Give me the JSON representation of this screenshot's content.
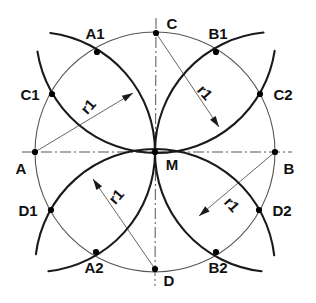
{
  "figure": {
    "type": "geometric-construction",
    "colors": {
      "arc_stroke": "#1a1a1a",
      "circle_stroke": "#555555",
      "axis_stroke": "#555555",
      "label_text": "#111111",
      "point_fill": "#000000",
      "background": "#ffffff"
    },
    "geometry": {
      "center": {
        "name": "M",
        "x": 155,
        "y": 152
      },
      "circle_radius": 120,
      "arc_radius_label": "r1",
      "arc_radius_value": 120
    },
    "points": [
      {
        "name": "A",
        "x": 35,
        "y": 152,
        "label_dx": -14,
        "label_dy": 22,
        "anchor": "middle"
      },
      {
        "name": "B",
        "x": 275,
        "y": 152,
        "label_dx": 14,
        "label_dy": 22,
        "anchor": "middle"
      },
      {
        "name": "C",
        "x": 156,
        "y": 33,
        "label_dx": 16,
        "label_dy": -4,
        "anchor": "middle"
      },
      {
        "name": "D",
        "x": 155,
        "y": 269,
        "label_dx": 14,
        "label_dy": 17,
        "anchor": "middle"
      },
      {
        "name": "M",
        "x": 155,
        "y": 152,
        "label_dx": 17,
        "label_dy": 18,
        "anchor": "middle"
      },
      {
        "name": "A1",
        "x": 97,
        "y": 52,
        "label_dx": -2,
        "label_dy": -13,
        "anchor": "middle"
      },
      {
        "name": "B1",
        "x": 216,
        "y": 52,
        "label_dx": 2,
        "label_dy": -13,
        "anchor": "middle"
      },
      {
        "name": "C1",
        "x": 52,
        "y": 94,
        "label_dx": -22,
        "label_dy": 6,
        "anchor": "middle"
      },
      {
        "name": "C2",
        "x": 260,
        "y": 94,
        "label_dx": 23,
        "label_dy": 6,
        "anchor": "middle"
      },
      {
        "name": "D1",
        "x": 51,
        "y": 210,
        "label_dx": -23,
        "label_dy": 6,
        "anchor": "middle"
      },
      {
        "name": "D2",
        "x": 259,
        "y": 210,
        "label_dx": 23,
        "label_dy": 6,
        "anchor": "middle"
      },
      {
        "name": "A2",
        "x": 96,
        "y": 252,
        "label_dx": -2,
        "label_dy": 21,
        "anchor": "middle"
      },
      {
        "name": "B2",
        "x": 216,
        "y": 252,
        "label_dx": 2,
        "label_dy": 21,
        "anchor": "middle"
      }
    ],
    "arcs": [
      {
        "id": "arc-from-A",
        "center": "A",
        "from_point": "C1",
        "through": "M",
        "to_point": "D1"
      },
      {
        "id": "arc-from-B",
        "center": "B",
        "from_point": "C2",
        "through": "M",
        "to_point": "D2"
      },
      {
        "id": "arc-from-C",
        "center": "C",
        "from_point": "A1",
        "through": "M",
        "to_point": "B1"
      },
      {
        "id": "arc-from-D",
        "center": "D",
        "from_point": "A2",
        "through": "M",
        "to_point": "B2"
      }
    ],
    "radius_annotations": [
      {
        "id": "r1-top-left",
        "label": "r1",
        "from": "A",
        "arrow_x": 133,
        "arrow_y": 93,
        "text_x": 92,
        "text_y": 110,
        "rotation": -48
      },
      {
        "id": "r1-top-right",
        "label": "r1",
        "from": "C",
        "arrow_x": 219,
        "arrow_y": 127,
        "text_x": 201,
        "text_y": 96,
        "rotation": 48
      },
      {
        "id": "r1-bottom-left",
        "label": "r1",
        "from": "D",
        "arrow_x": 93,
        "arrow_y": 179,
        "text_x": 120,
        "text_y": 200,
        "rotation": -48
      },
      {
        "id": "r1-bottom-right",
        "label": "r1",
        "from": "B",
        "arrow_x": 199,
        "arrow_y": 216,
        "text_x": 228,
        "text_y": 208,
        "rotation": 48
      }
    ],
    "axes": [
      {
        "id": "horizontal-axis",
        "x1": 22,
        "y1": 152,
        "x2": 292,
        "y2": 152
      },
      {
        "id": "vertical-axis",
        "x1": 156,
        "y1": 18,
        "x2": 155,
        "y2": 286
      }
    ]
  }
}
